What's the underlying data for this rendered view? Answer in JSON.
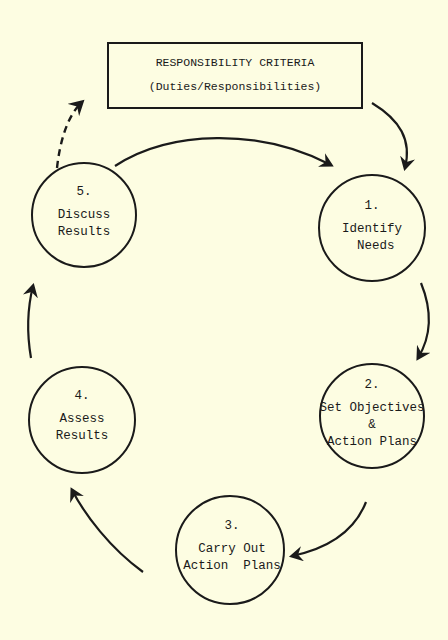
{
  "diagram": {
    "type": "cycle",
    "background": "#fdfde2",
    "ink_color": "#1a1a1a",
    "header_box": {
      "title": "RESPONSIBILITY CRITERIA",
      "subtitle": "(Duties/Responsibilities)"
    },
    "steps": [
      {
        "number": "1.",
        "lines": [
          "Identify",
          " Needs"
        ]
      },
      {
        "number": "2.",
        "lines": [
          "Set Objectives",
          "&",
          "Action Plans"
        ]
      },
      {
        "number": "3.",
        "lines": [
          "Carry Out",
          "Action  Plans"
        ]
      },
      {
        "number": "4.",
        "lines": [
          "Assess",
          "Results"
        ]
      },
      {
        "number": "5.",
        "lines": [
          "Discuss",
          "Results"
        ]
      }
    ],
    "edges": [
      {
        "from": "RESPONSIBILITY CRITERIA",
        "to": "1.",
        "style": "solid"
      },
      {
        "from": "5.",
        "to": "1.",
        "style": "solid"
      },
      {
        "from": "1.",
        "to": "2.",
        "style": "solid"
      },
      {
        "from": "2.",
        "to": "3.",
        "style": "solid"
      },
      {
        "from": "3.",
        "to": "4.",
        "style": "solid"
      },
      {
        "from": "4.",
        "to": "5.",
        "style": "solid"
      },
      {
        "from": "5.",
        "to": "RESPONSIBILITY CRITERIA",
        "style": "dashed"
      }
    ]
  }
}
